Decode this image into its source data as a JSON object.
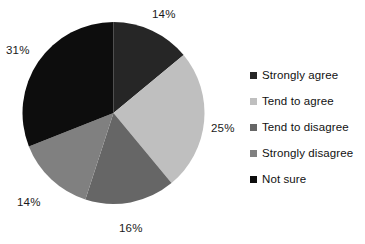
{
  "chart_data": {
    "type": "pie",
    "title": "",
    "categories": [
      "Strongly agree",
      "Tend to agree",
      "Tend to disagree",
      "Strongly disagree",
      "Not sure"
    ],
    "values": [
      14,
      25,
      16,
      14,
      31
    ],
    "value_labels": [
      "14%",
      "25%",
      "16%",
      "14%",
      "31%"
    ],
    "unit": "%",
    "colors": [
      "#262626",
      "#bfbfbf",
      "#666666",
      "#808080",
      "#0d0d0d"
    ],
    "start_angle_deg": 0,
    "direction": "clockwise",
    "legend_position": "right",
    "grid": false,
    "slices": [
      {
        "label": "Strongly agree",
        "value": 14,
        "display": "14%",
        "color": "#262626"
      },
      {
        "label": "Tend to agree",
        "value": 25,
        "display": "25%",
        "color": "#bfbfbf"
      },
      {
        "label": "Tend to disagree",
        "value": 16,
        "display": "16%",
        "color": "#666666"
      },
      {
        "label": "Strongly disagree",
        "value": 14,
        "display": "14%",
        "color": "#808080"
      },
      {
        "label": "Not sure",
        "value": 31,
        "display": "31%",
        "color": "#0d0d0d"
      }
    ]
  },
  "labels": {
    "strongly_agree_pct": "14%",
    "tend_to_agree_pct": "25%",
    "tend_to_disagree_pct": "16%",
    "strongly_disagree_pct": "14%",
    "not_sure_pct": "31%"
  },
  "legend": {
    "items": [
      {
        "label": "Strongly agree",
        "color": "#262626"
      },
      {
        "label": "Tend to agree",
        "color": "#bfbfbf"
      },
      {
        "label": "Tend to disagree",
        "color": "#666666"
      },
      {
        "label": "Strongly disagree",
        "color": "#808080"
      },
      {
        "label": "Not sure",
        "color": "#0d0d0d"
      }
    ]
  }
}
